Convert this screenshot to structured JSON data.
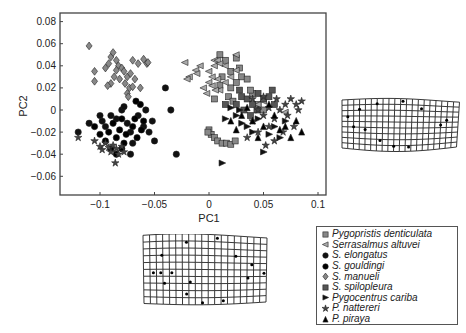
{
  "chart_data": {
    "type": "scatter",
    "title": "",
    "xlabel": "PC1",
    "ylabel": "PC2",
    "xlim": [
      -0.135,
      0.11
    ],
    "ylim": [
      -0.077,
      0.088
    ],
    "xticks": [
      "-0.1",
      "-0.05",
      "0",
      "0.05",
      "0.1"
    ],
    "yticks": [
      "0.08",
      "0.06",
      "0.04",
      "0.02",
      "0",
      "-0.02",
      "-0.04",
      "-0.06"
    ],
    "grid": false,
    "legend_position": "bottom-right, outside plot",
    "series": [
      {
        "name": "Pygopristis denticulata",
        "marker": "square",
        "color": "#888888",
        "points": [
          [
            0.01,
            0.05
          ],
          [
            0.015,
            0.045
          ],
          [
            0.025,
            0.047
          ],
          [
            0.028,
            0.038
          ],
          [
            0.03,
            0.03
          ],
          [
            0.02,
            0.035
          ],
          [
            0.012,
            0.03
          ],
          [
            0.01,
            0.022
          ],
          [
            0.02,
            0.02
          ],
          [
            0.025,
            0.025
          ],
          [
            0.035,
            0.028
          ],
          [
            0.018,
            0.012
          ],
          [
            0.022,
            0.008
          ],
          [
            0.005,
            0.01
          ],
          [
            0.0,
            -0.018
          ],
          [
            0.002,
            -0.022
          ],
          [
            -0.001,
            -0.02
          ],
          [
            0.005,
            -0.025
          ],
          [
            0.008,
            -0.028
          ],
          [
            0.012,
            -0.03
          ],
          [
            0.016,
            -0.03
          ],
          [
            0.02,
            -0.031
          ],
          [
            0.024,
            -0.028
          ],
          [
            0.04,
            0.015
          ],
          [
            0.045,
            0.005
          ],
          [
            0.05,
            0.0
          ],
          [
            0.038,
            0.018
          ]
        ]
      },
      {
        "name": "Serrasalmus altuvei",
        "marker": "triangle-left",
        "color": "#aaaaaa",
        "points": [
          [
            -0.022,
            0.043
          ],
          [
            -0.012,
            0.036
          ],
          [
            -0.011,
            0.033
          ],
          [
            0.005,
            0.045
          ],
          [
            0.008,
            0.045
          ],
          [
            -0.008,
            0.04
          ],
          [
            0.0,
            0.035
          ],
          [
            0.005,
            0.04
          ],
          [
            0.01,
            0.042
          ],
          [
            0.015,
            0.04
          ],
          [
            0.0,
            0.025
          ],
          [
            0.003,
            0.022
          ],
          [
            0.008,
            0.028
          ],
          [
            -0.005,
            0.02
          ],
          [
            -0.002,
            0.015
          ],
          [
            0.01,
            0.018
          ],
          [
            0.015,
            0.025
          ],
          [
            0.025,
            0.05
          ],
          [
            0.025,
            0.036
          ],
          [
            0.02,
            0.03
          ],
          [
            0.003,
            0.03
          ],
          [
            0.006,
            0.018
          ],
          [
            -0.018,
            0.03
          ],
          [
            -0.02,
            0.028
          ],
          [
            0.045,
            0.005
          ],
          [
            0.05,
            0.008
          ],
          [
            0.07,
            -0.002
          ]
        ]
      },
      {
        "name": "S. elongatus",
        "marker": "circle",
        "color": "#111111",
        "points": [
          [
            -0.12,
            -0.02
          ],
          [
            -0.11,
            -0.012
          ],
          [
            -0.1,
            -0.005
          ],
          [
            -0.098,
            -0.01
          ],
          [
            -0.095,
            -0.015
          ],
          [
            -0.09,
            -0.005
          ],
          [
            -0.085,
            -0.008
          ],
          [
            -0.08,
            0.0
          ],
          [
            -0.078,
            0.003
          ],
          [
            -0.075,
            -0.012
          ],
          [
            -0.072,
            -0.02
          ],
          [
            -0.07,
            -0.03
          ],
          [
            -0.065,
            -0.005
          ],
          [
            -0.06,
            -0.015
          ],
          [
            -0.055,
            -0.02
          ],
          [
            -0.05,
            -0.028
          ],
          [
            -0.052,
            -0.01
          ],
          [
            -0.058,
            0.0
          ],
          [
            -0.04,
            0.02
          ],
          [
            -0.035,
            0.0
          ],
          [
            -0.03,
            -0.04
          ],
          [
            -0.072,
            -0.04
          ]
        ]
      },
      {
        "name": "S. gouldingi",
        "marker": "circle",
        "color": "#000000",
        "points": [
          [
            -0.105,
            -0.015
          ],
          [
            -0.1,
            -0.022
          ],
          [
            -0.095,
            -0.028
          ],
          [
            -0.092,
            -0.02
          ],
          [
            -0.088,
            -0.012
          ],
          [
            -0.085,
            -0.025
          ],
          [
            -0.082,
            -0.018
          ],
          [
            -0.08,
            -0.008
          ],
          [
            -0.078,
            -0.03
          ],
          [
            -0.076,
            -0.022
          ],
          [
            -0.07,
            -0.015
          ],
          [
            -0.068,
            -0.008
          ],
          [
            -0.066,
            -0.025
          ],
          [
            -0.062,
            -0.018
          ],
          [
            -0.06,
            -0.01
          ],
          [
            -0.063,
            0.005
          ],
          [
            -0.067,
            0.008
          ],
          [
            -0.09,
            -0.035
          ],
          [
            -0.085,
            -0.04
          ],
          [
            -0.08,
            -0.035
          ]
        ]
      },
      {
        "name": "S. manueli",
        "marker": "diamond",
        "color": "#888888",
        "points": [
          [
            -0.11,
            0.058
          ],
          [
            -0.105,
            0.035
          ],
          [
            -0.105,
            0.026
          ],
          [
            -0.095,
            0.038
          ],
          [
            -0.092,
            0.042
          ],
          [
            -0.09,
            0.048
          ],
          [
            -0.088,
            0.052
          ],
          [
            -0.085,
            0.045
          ],
          [
            -0.083,
            0.04
          ],
          [
            -0.08,
            0.038
          ],
          [
            -0.078,
            0.035
          ],
          [
            -0.075,
            0.03
          ],
          [
            -0.072,
            0.033
          ],
          [
            -0.07,
            0.045
          ],
          [
            -0.068,
            0.028
          ],
          [
            -0.065,
            0.042
          ],
          [
            -0.06,
            0.046
          ],
          [
            -0.057,
            0.042
          ],
          [
            -0.056,
            0.043
          ],
          [
            -0.087,
            0.03
          ],
          [
            -0.09,
            0.024
          ],
          [
            -0.093,
            0.022
          ],
          [
            -0.082,
            0.028
          ],
          [
            -0.077,
            0.024
          ],
          [
            -0.073,
            0.02
          ],
          [
            -0.07,
            0.021
          ],
          [
            -0.075,
            0.015
          ],
          [
            -0.074,
            0.012
          ],
          [
            -0.063,
            0.02
          ],
          [
            -0.085,
            0.036
          ]
        ]
      },
      {
        "name": "S. spilopleura",
        "marker": "square",
        "color": "#555555",
        "points": [
          [
            0.03,
            0.012
          ],
          [
            0.035,
            0.01
          ],
          [
            0.04,
            0.005
          ],
          [
            0.045,
            0.015
          ],
          [
            0.05,
            0.01
          ],
          [
            0.055,
            0.012
          ],
          [
            0.06,
            0.005
          ],
          [
            0.032,
            0.0
          ],
          [
            0.038,
            -0.005
          ],
          [
            0.044,
            0.0
          ],
          [
            0.025,
            0.005
          ],
          [
            0.028,
            0.018
          ],
          [
            0.015,
            0.005
          ],
          [
            0.058,
            0.018
          ]
        ]
      },
      {
        "name": "Pygocentrus cariba",
        "marker": "triangle-right",
        "color": "#111111",
        "points": [
          [
            0.012,
            -0.048
          ],
          [
            0.05,
            -0.038
          ],
          [
            0.028,
            0.0
          ],
          [
            0.025,
            -0.005
          ],
          [
            0.03,
            -0.012
          ],
          [
            0.04,
            -0.02
          ],
          [
            0.06,
            -0.015
          ],
          [
            0.07,
            -0.01
          ],
          [
            0.045,
            -0.008
          ],
          [
            0.055,
            -0.022
          ],
          [
            0.065,
            -0.025
          ],
          [
            0.035,
            -0.015
          ],
          [
            0.02,
            0.002
          ],
          [
            0.015,
            -0.008
          ]
        ]
      },
      {
        "name": "P. nattereri",
        "marker": "star",
        "color": "#444444",
        "points": [
          [
            -0.12,
            -0.025
          ],
          [
            -0.105,
            -0.028
          ],
          [
            -0.1,
            -0.033
          ],
          [
            -0.098,
            -0.036
          ],
          [
            -0.095,
            -0.03
          ],
          [
            -0.092,
            -0.034
          ],
          [
            -0.09,
            -0.038
          ],
          [
            -0.088,
            -0.032
          ],
          [
            -0.085,
            -0.035
          ],
          [
            -0.083,
            -0.04
          ],
          [
            -0.086,
            -0.048
          ],
          [
            -0.08,
            -0.033
          ],
          [
            -0.078,
            -0.038
          ],
          [
            0.04,
            0.01
          ],
          [
            0.045,
            0.0
          ],
          [
            0.05,
            -0.005
          ],
          [
            0.055,
            0.002
          ],
          [
            0.06,
            -0.008
          ],
          [
            0.065,
            0.0
          ],
          [
            0.07,
            0.005
          ],
          [
            0.075,
            0.01
          ],
          [
            0.08,
            0.005
          ],
          [
            0.085,
            0.008
          ],
          [
            0.055,
            -0.015
          ],
          [
            0.045,
            -0.02
          ],
          [
            0.035,
            -0.025
          ],
          [
            0.06,
            -0.028
          ],
          [
            0.068,
            -0.02
          ],
          [
            0.078,
            -0.015
          ],
          [
            0.05,
            0.012
          ],
          [
            0.04,
            -0.01
          ],
          [
            0.072,
            -0.005
          ],
          [
            0.052,
            -0.032
          ],
          [
            0.062,
            0.01
          ],
          [
            0.082,
            0.0
          ]
        ]
      },
      {
        "name": "P. piraya",
        "marker": "triangle-up",
        "color": "#000000",
        "points": [
          [
            0.02,
            -0.01
          ],
          [
            0.03,
            -0.005
          ],
          [
            0.04,
            -0.01
          ],
          [
            0.05,
            -0.015
          ],
          [
            0.06,
            -0.005
          ],
          [
            0.07,
            -0.015
          ],
          [
            0.08,
            -0.01
          ],
          [
            0.085,
            -0.02
          ],
          [
            0.075,
            -0.025
          ],
          [
            0.055,
            0.005
          ],
          [
            0.045,
            -0.025
          ],
          [
            0.065,
            -0.018
          ],
          [
            0.035,
            0.002
          ],
          [
            0.025,
            -0.018
          ]
        ]
      }
    ]
  },
  "axes": {
    "xlabel": "PC1",
    "ylabel": "PC2"
  },
  "legend": {
    "items": [
      {
        "label": "Pygopristis denticulata",
        "marker": "square",
        "color": "#888888"
      },
      {
        "label": "Serrasalmus altuvei",
        "marker": "triangle-left",
        "color": "#aaaaaa"
      },
      {
        "label": "S. elongatus",
        "marker": "circle",
        "color": "#111111"
      },
      {
        "label": "S. gouldingi",
        "marker": "circle",
        "color": "#000000"
      },
      {
        "label": "S. manueli",
        "marker": "diamond",
        "color": "#888888"
      },
      {
        "label": "S. spilopleura",
        "marker": "square",
        "color": "#555555"
      },
      {
        "label": "Pygocentrus cariba",
        "marker": "triangle-right",
        "color": "#111111"
      },
      {
        "label": "P. nattereri",
        "marker": "star",
        "color": "#444444"
      },
      {
        "label": "P. piraya",
        "marker": "triangle-up",
        "color": "#000000"
      }
    ]
  },
  "deformation_grids": [
    {
      "id": "right",
      "position": "right of plot (PC1 positive)"
    },
    {
      "id": "bottom",
      "position": "below plot (PC1 negative)"
    }
  ]
}
